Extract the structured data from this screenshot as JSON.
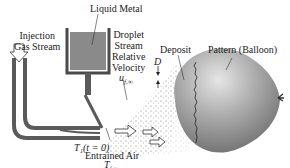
{
  "labels": {
    "liquid_metal": "Liquid Metal",
    "injection_line1": "Injection",
    "injection_line2": "Gas Stream",
    "droplet_line1": "Droplet",
    "droplet_line2": "Stream",
    "droplet_line3": "Relative",
    "droplet_line4": "Velocity",
    "velocity_symbol": "u",
    "velocity_sub": "f,∞",
    "deposit": "Deposit",
    "pattern": "Pattern (Balloon)",
    "diameter_symbol": "D",
    "temperature_initial": "T₁(t = 0)",
    "entrained_line1": "Entrained Air",
    "entrained_symbol": "T",
    "entrained_sub": "f,∞"
  },
  "colors": {
    "metal": "#6e6e6e",
    "metal_fill": "#8a8a8a",
    "balloon_light": "#d8d8d8",
    "balloon_dark": "#7a7a7a",
    "spray": "#9a9a9a"
  }
}
